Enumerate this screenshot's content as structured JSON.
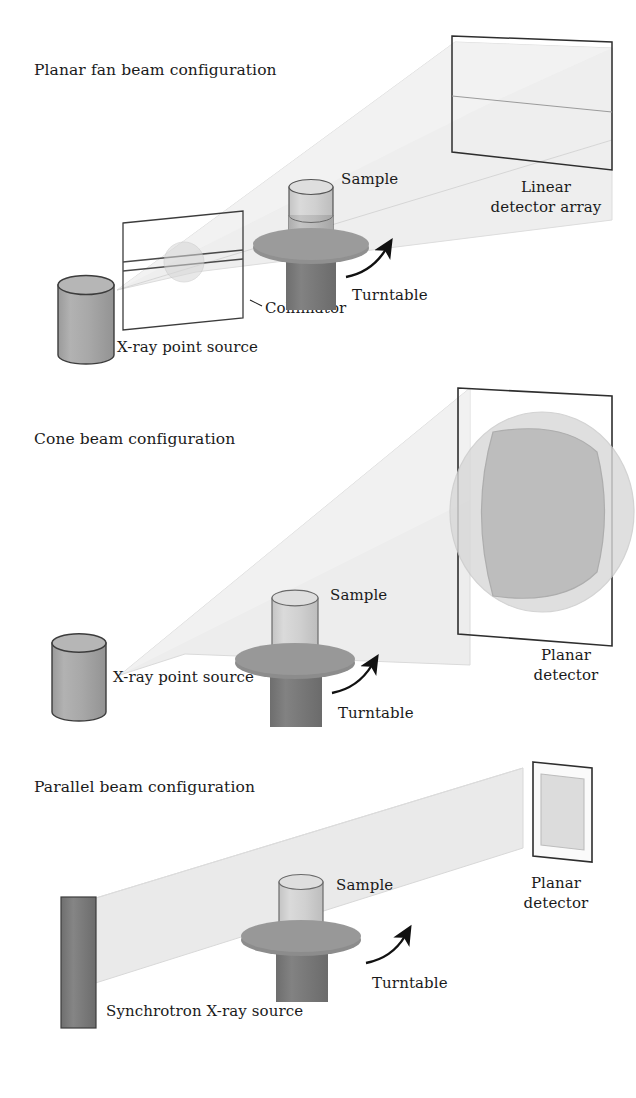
{
  "figure": {
    "kind": "x-ray-ct-beam-configuration-diagram",
    "background_color": "#ffffff",
    "text_color": "#1a1a1a"
  },
  "palette": {
    "beam": "#e9e9e9",
    "beam_edge": "#d8d8d8",
    "source_cylinder": "#a6a6a6",
    "source_cylinder_top": "#b4b4b4",
    "sample_light": "#d2d2d2",
    "sample_top": "#dcdcdc",
    "sample_shaded": "#b9b9b9",
    "turntable": "#909090",
    "pedestal": "#787878",
    "synchrotron_source": "#7d7d7d",
    "outline": "#3c3c3c",
    "detector_outline": "#2e2e2e",
    "projection_outer": "#d5d5d5",
    "projection_inner": "#b6b6b6"
  },
  "panels": [
    {
      "id": "planar-fan-beam",
      "title": "Planar fan beam configuration",
      "labels": {
        "source": "X-ray point source",
        "collimator": "Collimator",
        "sample": "Sample",
        "turntable": "Turntable",
        "detector_line1": "Linear",
        "detector_line2": "detector array"
      }
    },
    {
      "id": "cone-beam",
      "title": "Cone beam configuration",
      "labels": {
        "source": "X-ray point source",
        "sample": "Sample",
        "turntable": "Turntable",
        "detector_line1": "Planar",
        "detector_line2": "detector"
      }
    },
    {
      "id": "parallel-beam",
      "title": "Parallel beam configuration",
      "labels": {
        "source": "Synchrotron X-ray source",
        "sample": "Sample",
        "turntable": "Turntable",
        "detector_line1": "Planar",
        "detector_line2": "detector"
      }
    }
  ]
}
